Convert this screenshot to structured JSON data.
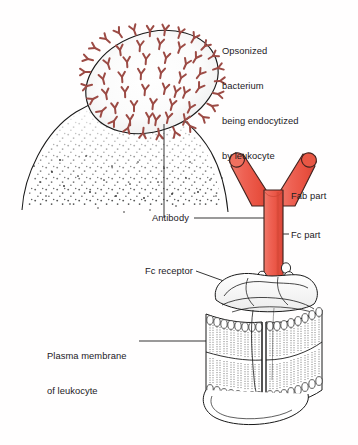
{
  "figure": {
    "background_color": "#fffefe",
    "line_color": "#1a1a1a",
    "text_color": "#23201f",
    "antibody_fill": "#ee6153",
    "antibody_shadow": "#d9483c",
    "antibody_outline": "#3a2420",
    "bacterial_antibody_color": "#9c4b45",
    "stipple_color": "#2b2b2b"
  },
  "labels": {
    "opsonized": {
      "line1": "Opsonized",
      "line2": "bacterium",
      "line3": "being endocytized",
      "line4": "by leukocyte"
    },
    "fab_part": "Fab part",
    "fc_part": "Fc part",
    "antibody": "Antibody",
    "fc_receptor": "Fc receptor",
    "plasma_membrane": {
      "line1": "Plasma membrane",
      "line2": "of leukocyte"
    }
  },
  "diagram_parts": [
    {
      "name": "opsonized-bacterium",
      "description": "oval bacterium coated with Y-shaped antibodies"
    },
    {
      "name": "leukocyte-cup",
      "description": "stippled cytoplasmic cup engulfing the bacterium"
    },
    {
      "name": "antibody-molecule",
      "description": "large red Y-shaped immunoglobulin"
    },
    {
      "name": "fc-receptor-protein",
      "description": "membrane protein binding the Fc stem"
    },
    {
      "name": "lipid-bilayer-block",
      "description": "phospholipid bilayer slab of leukocyte plasma membrane"
    }
  ]
}
